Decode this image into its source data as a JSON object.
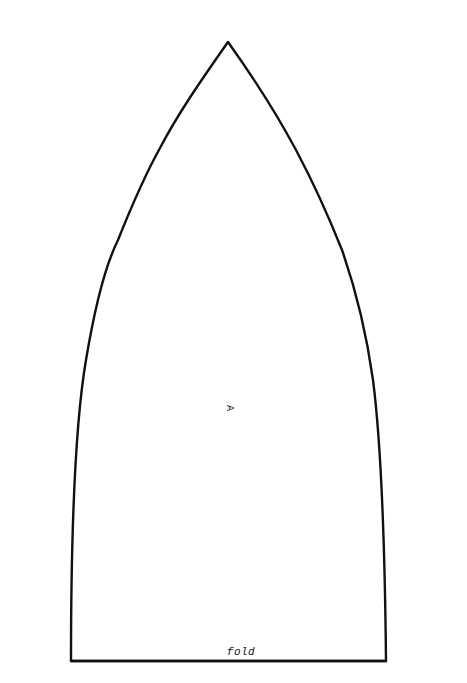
{
  "pattern": {
    "piece_label": "A",
    "fold_label": "fold",
    "outline_color": "#111111",
    "background_color": "#ffffff",
    "shape": {
      "apex": [
        228,
        42
      ],
      "bottom_left": [
        71,
        661
      ],
      "bottom_right": [
        386,
        661
      ]
    }
  }
}
